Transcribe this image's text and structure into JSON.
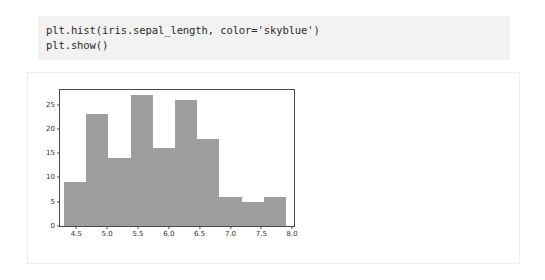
{
  "cell": {
    "code_lines": [
      "plt.hist(iris.sepal_length, color='skyblue')",
      "plt.show()"
    ]
  },
  "colors": {
    "code_background": "#f2f2f2",
    "code_text": "#2b2b2b",
    "output_background": "#ffffff",
    "output_border": "#eeeeee",
    "bar_fill": "#9e9e9e",
    "axis_spine": "#4a4a4a",
    "tick_text": "#333333"
  },
  "chart_data": {
    "type": "bar",
    "title": "",
    "xlabel": "",
    "ylabel": "",
    "grid": false,
    "legend": null,
    "xlim": [
      4.3,
      7.9
    ],
    "ylim": [
      0,
      28
    ],
    "bin_edges": [
      4.3,
      4.66,
      5.02,
      5.38,
      5.74,
      6.1,
      6.46,
      6.82,
      7.18,
      7.54,
      7.9
    ],
    "categories": [
      "4.30-4.66",
      "4.66-5.02",
      "5.02-5.38",
      "5.38-5.74",
      "5.74-6.10",
      "6.10-6.46",
      "6.46-6.82",
      "6.82-7.18",
      "7.18-7.54",
      "7.54-7.90"
    ],
    "values": [
      9,
      23,
      14,
      27,
      16,
      26,
      18,
      6,
      5,
      6
    ],
    "xticks": [
      "4.5",
      "5.0",
      "5.5",
      "6.0",
      "6.5",
      "7.0",
      "7.5",
      "8.0"
    ],
    "xtick_values": [
      4.5,
      5.0,
      5.5,
      6.0,
      6.5,
      7.0,
      7.5,
      8.0
    ],
    "yticks": [
      "0",
      "5",
      "10",
      "15",
      "20",
      "25"
    ],
    "ytick_values": [
      0,
      5,
      10,
      15,
      20,
      25
    ]
  }
}
